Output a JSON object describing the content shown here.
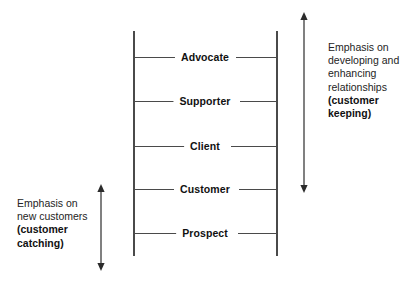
{
  "diagram": {
    "type": "ladder-diagram",
    "background_color": "#ffffff",
    "line_color": "#4a4a4a",
    "text_color": "#1a1a1a"
  },
  "ladder": {
    "rungs": [
      {
        "label": "Advocate",
        "level": 5
      },
      {
        "label": "Supporter",
        "level": 4
      },
      {
        "label": "Client",
        "level": 3
      },
      {
        "label": "Customer",
        "level": 2
      },
      {
        "label": "Prospect",
        "level": 1
      }
    ]
  },
  "annotations": {
    "right": {
      "name": "customer-keeping",
      "lines": [
        "Emphasis on",
        "developing and",
        "enhancing",
        "relationships"
      ],
      "bold_lines": [
        "(customer",
        "keeping)"
      ],
      "arrow": "double-headed-vertical-arrow"
    },
    "left": {
      "name": "customer-catching",
      "lines": [
        "Emphasis on",
        "new customers"
      ],
      "bold_lines": [
        "(customer",
        "catching)"
      ],
      "arrow": "double-headed-vertical-arrow"
    }
  }
}
